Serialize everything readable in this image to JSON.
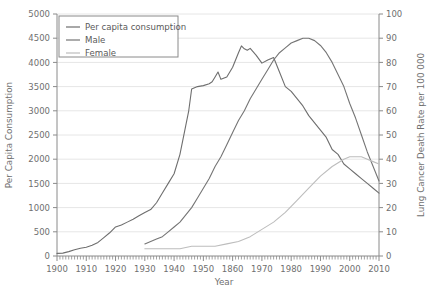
{
  "chart_data": {
    "type": "line",
    "title": "",
    "xlabel": "Year",
    "ylabel": "Per Capita Consumption",
    "y2label": "Lung Cancer Death Rate per 100 000",
    "xlim": [
      1900,
      2010
    ],
    "ylim": [
      0,
      5000
    ],
    "y2lim": [
      0,
      100
    ],
    "grid": true,
    "legend_position": "top-left",
    "x_tick_labels": [
      "1900",
      "1910",
      "1920",
      "1930",
      "1940",
      "1950",
      "1860",
      "1970",
      "1980",
      "1990",
      "2000",
      "2010"
    ],
    "x_tick_values": [
      1900,
      1910,
      1920,
      1930,
      1940,
      1950,
      1960,
      1970,
      1980,
      1990,
      2000,
      2010
    ],
    "x_minor_tick_step": 1,
    "y_tick_labels": [
      "0",
      "500",
      "1000",
      "1500",
      "2000",
      "2500",
      "3000",
      "3500",
      "4000",
      "4500",
      "5000"
    ],
    "y_tick_values": [
      0,
      500,
      1000,
      1500,
      2000,
      2500,
      3000,
      3500,
      4000,
      4500,
      5000
    ],
    "y2_tick_labels": [
      "0",
      "10",
      "20",
      "30",
      "40",
      "50",
      "60",
      "70",
      "80",
      "90",
      "100"
    ],
    "y2_tick_values": [
      0,
      10,
      20,
      30,
      40,
      50,
      60,
      70,
      80,
      90,
      100
    ],
    "series": [
      {
        "name": "Per capita consumption",
        "axis": "left",
        "color": "#6e6e6e",
        "x": [
          1900,
          1902,
          1904,
          1906,
          1908,
          1910,
          1912,
          1914,
          1916,
          1918,
          1920,
          1922,
          1924,
          1926,
          1928,
          1930,
          1932,
          1934,
          1936,
          1938,
          1940,
          1942,
          1944,
          1945,
          1946,
          1948,
          1950,
          1952,
          1953,
          1954,
          1955,
          1956,
          1958,
          1960,
          1962,
          1963,
          1964,
          1965,
          1966,
          1968,
          1970,
          1972,
          1974,
          1976,
          1978,
          1980,
          1982,
          1984,
          1986,
          1988,
          1990,
          1992,
          1994,
          1996,
          1998,
          2000,
          2002,
          2004,
          2006,
          2008,
          2010
        ],
        "y": [
          54,
          60,
          90,
          130,
          160,
          180,
          223,
          280,
          380,
          480,
          600,
          640,
          700,
          760,
          830,
          900,
          960,
          1100,
          1300,
          1500,
          1700,
          2100,
          2700,
          3000,
          3450,
          3500,
          3520,
          3560,
          3600,
          3700,
          3800,
          3650,
          3700,
          3900,
          4200,
          4340,
          4280,
          4250,
          4290,
          4150,
          3985,
          4050,
          4100,
          3800,
          3500,
          3400,
          3250,
          3100,
          2900,
          2750,
          2600,
          2450,
          2200,
          2100,
          1900,
          1800,
          1700,
          1600,
          1500,
          1400,
          1300
        ]
      },
      {
        "name": "Male",
        "axis": "right",
        "color": "#757575",
        "x": [
          1930,
          1932,
          1934,
          1936,
          1938,
          1940,
          1942,
          1944,
          1946,
          1948,
          1950,
          1952,
          1954,
          1956,
          1958,
          1960,
          1962,
          1964,
          1966,
          1968,
          1970,
          1972,
          1974,
          1976,
          1978,
          1980,
          1982,
          1984,
          1986,
          1988,
          1990,
          1992,
          1994,
          1996,
          1998,
          2000,
          2002,
          2004,
          2006,
          2008,
          2010
        ],
        "y": [
          5,
          6,
          7,
          8,
          10,
          12,
          14,
          17,
          20,
          24,
          28,
          32,
          37,
          41,
          46,
          51,
          56,
          60,
          65,
          69,
          73,
          77,
          81,
          84,
          86,
          88,
          89,
          90,
          90,
          89,
          87,
          84,
          80,
          75,
          70,
          63,
          57,
          50,
          43,
          37,
          31
        ]
      },
      {
        "name": "Female",
        "axis": "right",
        "color": "#bdbdbd",
        "x": [
          1930,
          1934,
          1938,
          1942,
          1946,
          1950,
          1954,
          1958,
          1962,
          1966,
          1970,
          1974,
          1978,
          1982,
          1986,
          1990,
          1994,
          1998,
          2000,
          2002,
          2004,
          2006,
          2008,
          2010
        ],
        "y": [
          3,
          3,
          3,
          3,
          4,
          4,
          4,
          5,
          6,
          8,
          11,
          14,
          18,
          23,
          28,
          33,
          37,
          40,
          41,
          41,
          41,
          40,
          39,
          38
        ]
      }
    ]
  },
  "legend": {
    "entries": [
      {
        "label": "Per capita consumption"
      },
      {
        "label": "Male"
      },
      {
        "label": "Female"
      }
    ]
  }
}
